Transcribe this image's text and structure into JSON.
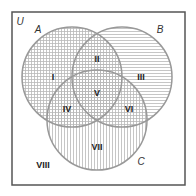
{
  "universe": {
    "label": "U"
  },
  "sets": [
    {
      "id": "A",
      "label": "A",
      "cx": 72,
      "cy": 77,
      "r": 50,
      "pattern": "grid"
    },
    {
      "id": "B",
      "label": "B",
      "cx": 122,
      "cy": 77,
      "r": 50,
      "pattern": "horizontal"
    },
    {
      "id": "C",
      "label": "C",
      "cx": 97,
      "cy": 120,
      "r": 50,
      "pattern": "vertical"
    }
  ],
  "regions": [
    {
      "label": "I",
      "x": 52,
      "y": 77
    },
    {
      "label": "II",
      "x": 97,
      "y": 57
    },
    {
      "label": "III",
      "x": 142,
      "y": 77
    },
    {
      "label": "IV",
      "x": 67,
      "y": 112
    },
    {
      "label": "V",
      "x": 97,
      "y": 97
    },
    {
      "label": "VI",
      "x": 127,
      "y": 112
    },
    {
      "label": "VII",
      "x": 97,
      "y": 148
    },
    {
      "label": "VIII",
      "x": 37,
      "y": 168
    }
  ],
  "colors": {
    "border": "#555555",
    "circle": "#999999",
    "hatch": "#b8b8b8"
  }
}
